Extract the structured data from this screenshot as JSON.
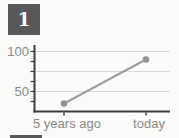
{
  "badge": {
    "label": "1"
  },
  "chart_data": {
    "type": "line",
    "categories": [
      "5 years ago",
      "today"
    ],
    "values": [
      35,
      90
    ],
    "title": "",
    "xlabel": "",
    "ylabel": "",
    "ylim": [
      25,
      108
    ],
    "ytick_labels": [
      "100",
      "50"
    ],
    "ytick_label_values": [
      100,
      50
    ],
    "gridline_values": [
      100,
      75,
      50
    ],
    "minor_tick_values": [
      100,
      87.5,
      75,
      62.5,
      50,
      37.5
    ],
    "grid": true,
    "legend": false
  },
  "colors": {
    "badge_bg": "#58585a",
    "badge_text": "#ffffff",
    "axis": "#3f3f3f",
    "gridline": "#d9d9d9",
    "series_line": "#9e9e9e",
    "point": "#929292",
    "tick_label": "#8b8b8b",
    "background": "#fbfbfa"
  }
}
